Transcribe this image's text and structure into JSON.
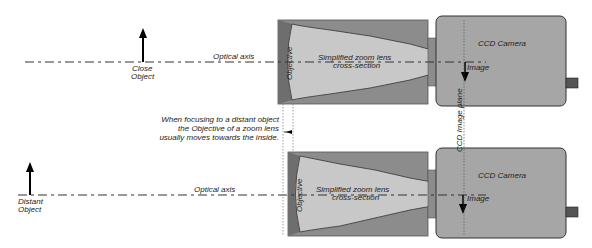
{
  "top": {
    "object_label_line1": "Close",
    "object_label_line2": "Object",
    "axis_label": "Optical axis",
    "objective_label": "Objective",
    "lens_label_line1": "Simplified zoom lens",
    "lens_label_line2": "cross-section",
    "camera_label": "CCD Camera",
    "image_label": "Image"
  },
  "bottom": {
    "object_label_line1": "Distant",
    "object_label_line2": "Object",
    "axis_label": "Optical axis",
    "objective_label": "Objective",
    "lens_label_line1": "Simplified zoom lens",
    "lens_label_line2": "cross-section",
    "camera_label": "CCD Camera",
    "image_label": "Image"
  },
  "note": {
    "line1": "When focusing to a distant object",
    "line2": "the Objective of a zoom lens",
    "line3": "usually moves towards the inside."
  },
  "image_plane_label": "CCD Image plane",
  "colors": {
    "lens_housing": "#8c8c8c",
    "lens_inner": "#c8c8c8",
    "camera_body": "#a6a6a6",
    "objective": "#6e6e6e"
  }
}
